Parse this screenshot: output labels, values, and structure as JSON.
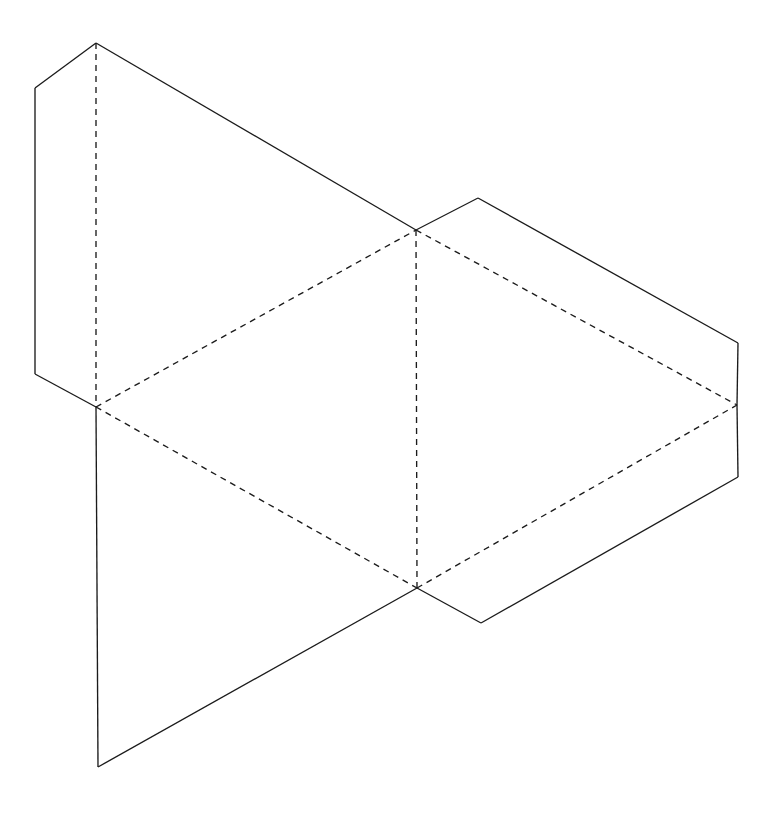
{
  "figure": {
    "kind": "line-drawing",
    "canvas": {
      "width": 770,
      "height": 814
    },
    "background_color": "#fdfdfd",
    "stroke_color": "#1b1b1b",
    "stroke_width": 1.35,
    "dash_pattern": "6 5",
    "vertices": {
      "A_top_apex": [
        96,
        43
      ],
      "B_upper_left": [
        35,
        88
      ],
      "C_lower_left": [
        35,
        374
      ],
      "D_left_junction": [
        96,
        407
      ],
      "E_upper_middle_junction": [
        416,
        230
      ],
      "F_right_peak": [
        478,
        198
      ],
      "G_right_top": [
        738,
        343
      ],
      "H_right_middle": [
        737,
        405
      ],
      "I_right_bottom": [
        738,
        477
      ],
      "J_lower_middle_junction": [
        417,
        588
      ],
      "K_notch_bottom": [
        481,
        623
      ],
      "L_bottom_left_point": [
        98,
        767
      ]
    },
    "solid_edges": [
      {
        "name": "apex-to-upper-left",
        "points": "96,43 35,88"
      },
      {
        "name": "left-vertical-front",
        "points": "35,88 35,374"
      },
      {
        "name": "lower-left-to-left-junction",
        "points": "35,374 96,407"
      },
      {
        "name": "apex-to-upper-middle-junction",
        "points": "96,43 416,230"
      },
      {
        "name": "upper-middle-junction-to-right-peak",
        "points": "416,230 478,198"
      },
      {
        "name": "right-peak-to-right-top",
        "points": "478,198 738,343"
      },
      {
        "name": "right-vertical-upper",
        "points": "738,343 737,405"
      },
      {
        "name": "right-vertical-lower",
        "points": "737,405 738,477"
      },
      {
        "name": "right-bottom-to-notch",
        "points": "738,477 481,623"
      },
      {
        "name": "notch-to-lower-middle-junction",
        "points": "481,623 417,588"
      },
      {
        "name": "lower-middle-junction-to-bottom-left-point",
        "points": "417,588 98,767"
      },
      {
        "name": "left-vertical-back",
        "points": "96,407 98,767"
      }
    ],
    "dashed_edges": [
      {
        "name": "hidden-vertical-left",
        "points": "96,43 96,407"
      },
      {
        "name": "hidden-vertical-middle",
        "points": "416,230 417,588"
      },
      {
        "name": "hidden-diagonal-upper-left",
        "points": "96,407 416,230"
      },
      {
        "name": "hidden-diagonal-lower-left",
        "points": "96,407 417,588"
      },
      {
        "name": "hidden-diagonal-upper-right",
        "points": "416,230 737,405"
      },
      {
        "name": "hidden-diagonal-lower-right",
        "points": "417,588 737,405"
      }
    ]
  }
}
